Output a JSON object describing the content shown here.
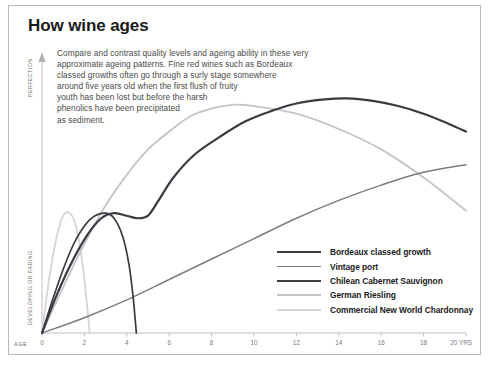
{
  "title": "How wine ages",
  "blurb_lines": [
    "Compare and contrast quality levels and ageing ability in these very",
    "approximate ageing patterns. Fine red wines such as Bordeaux",
    "classed growths often go through a surly stage somewhere",
    "around five years old when the first flush of fruity",
    "youth has been lost but before the harsh",
    "phenolics have been precipitated",
    "as sediment."
  ],
  "axis": {
    "y_top_label": "PERFECTION",
    "y_bottom_label": "DEVELOPING OR FADING",
    "x_start_label": "AGE",
    "x_unit_suffix": "YRS"
  },
  "chart_data": {
    "type": "line",
    "title": "How wine ages",
    "xlabel": "AGE (YRS)",
    "ylabel": "DEVELOPING OR FADING → PERFECTION",
    "xlim": [
      0,
      20
    ],
    "ylim": [
      0,
      100
    ],
    "grid": false,
    "legend_position": "inside-bottom-right",
    "xticks": [
      0,
      2,
      4,
      6,
      8,
      10,
      12,
      14,
      16,
      18,
      20
    ],
    "xticklabels": [
      "0",
      "2",
      "4",
      "6",
      "8",
      "10",
      "12",
      "14",
      "16",
      "18",
      "20"
    ],
    "yticks": [],
    "yticklabels": [],
    "series": [
      {
        "name": "Bordeaux classed growth",
        "color": "#3a3a42",
        "width": 2.2,
        "x": [
          0,
          0.6,
          1.3,
          2.1,
          2.8,
          3.4,
          4.0,
          4.5,
          5.0,
          5.5,
          6.2,
          7.2,
          8.4,
          9.6,
          10.8,
          12.0,
          13.2,
          14.4,
          15.6,
          16.8,
          18.0,
          19.2,
          20.0
        ],
        "y": [
          0,
          13,
          26,
          38,
          45,
          47,
          46,
          45,
          46,
          52,
          61,
          70,
          77,
          83,
          87,
          90,
          91.5,
          92,
          91,
          89,
          86,
          82,
          79
        ]
      },
      {
        "name": "Vintage port",
        "color": "#7c7c84",
        "width": 1.5,
        "x": [
          0,
          2,
          4,
          6,
          8,
          10,
          12,
          14,
          16,
          18,
          20
        ],
        "y": [
          0,
          6,
          13,
          21,
          29,
          37,
          45,
          52,
          58,
          63,
          66
        ]
      },
      {
        "name": "Chilean Cabernet Sauvignon",
        "color": "#3a3a42",
        "width": 1.7,
        "x": [
          0,
          0.5,
          1.0,
          1.5,
          2.0,
          2.5,
          3.0,
          3.4,
          3.8,
          4.1,
          4.3,
          4.45
        ],
        "y": [
          0,
          13,
          25,
          35,
          42,
          46,
          47,
          45,
          38,
          27,
          14,
          0
        ]
      },
      {
        "name": "German Riesling",
        "color": "#c4c4c8",
        "width": 1.8,
        "x": [
          0,
          1,
          2,
          3,
          4,
          5,
          6,
          7,
          8,
          9,
          10,
          12,
          14,
          16,
          18,
          20
        ],
        "y": [
          0,
          18,
          35,
          50,
          62,
          72,
          79,
          85,
          88,
          89.5,
          89,
          86,
          80,
          72,
          61,
          48
        ]
      },
      {
        "name": "Commercial New World Chardonnay",
        "color": "#d5d5d9",
        "width": 1.8,
        "x": [
          0,
          0.35,
          0.7,
          1.0,
          1.3,
          1.6,
          1.9,
          2.1,
          2.25
        ],
        "y": [
          0,
          22,
          38,
          46,
          47,
          42,
          28,
          13,
          0
        ]
      }
    ]
  },
  "legend": {
    "items": [
      {
        "label": "Bordeaux classed growth",
        "color": "#3a3a42",
        "thickness": "2.4px"
      },
      {
        "label": "Vintage port",
        "color": "#7c7c84",
        "thickness": "1.7px"
      },
      {
        "label": "Chilean Cabernet Sauvignon",
        "color": "#3a3a42",
        "thickness": "2.1px"
      },
      {
        "label": "German Riesling",
        "color": "#c4c4c8",
        "thickness": "1.9px"
      },
      {
        "label": "Commercial New World Chardonnay",
        "color": "#d5d5d9",
        "thickness": "1.9px"
      }
    ]
  }
}
